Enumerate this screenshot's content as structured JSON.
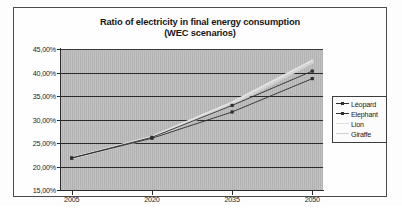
{
  "chart_data": {
    "type": "line",
    "title": "Ratio of electricity in final energy consumption",
    "subtitle": "(WEC scenarios)",
    "xlabel": "",
    "ylabel": "",
    "x": [
      2005,
      2020,
      2035,
      2050
    ],
    "xtick_labels": [
      "2005",
      "2020",
      "2035",
      "2050"
    ],
    "ytick_labels": [
      "45,00%",
      "40,00%",
      "35,00%",
      "30,00%",
      "25,00%",
      "20,00%",
      "15,00%"
    ],
    "ytick_values": [
      45,
      40,
      35,
      30,
      25,
      20,
      15
    ],
    "ylim": [
      15,
      45
    ],
    "xlim": [
      2003,
      2052
    ],
    "grid": "horizontal",
    "legend_position": "right",
    "plot_background": "#b6b6b6",
    "series": [
      {
        "name": "Léopard",
        "color": "#2e2e2e",
        "marker": "square",
        "values": [
          21.8,
          26.2,
          33.0,
          40.3
        ]
      },
      {
        "name": "Elephant",
        "color": "#2e2e2e",
        "marker": "square",
        "values": [
          21.8,
          26.0,
          31.6,
          38.7
        ]
      },
      {
        "name": "Lion",
        "color": "#e4e4e4",
        "marker": "none",
        "values": [
          21.8,
          26.3,
          33.6,
          42.5
        ]
      },
      {
        "name": "Giraffe",
        "color": "#d2d2d2",
        "marker": "none",
        "values": [
          21.8,
          26.1,
          33.2,
          42.1
        ]
      }
    ]
  },
  "legend": {
    "items": [
      {
        "label": "Léopard",
        "color": "#2e2e2e",
        "marker": "square"
      },
      {
        "label": "Elephant",
        "color": "#2e2e2e",
        "marker": "square"
      },
      {
        "label": "Lion",
        "color": "#e0e0e0",
        "marker": "none"
      },
      {
        "label": "Giraffe",
        "color": "#cfcfcf",
        "marker": "none"
      }
    ]
  }
}
